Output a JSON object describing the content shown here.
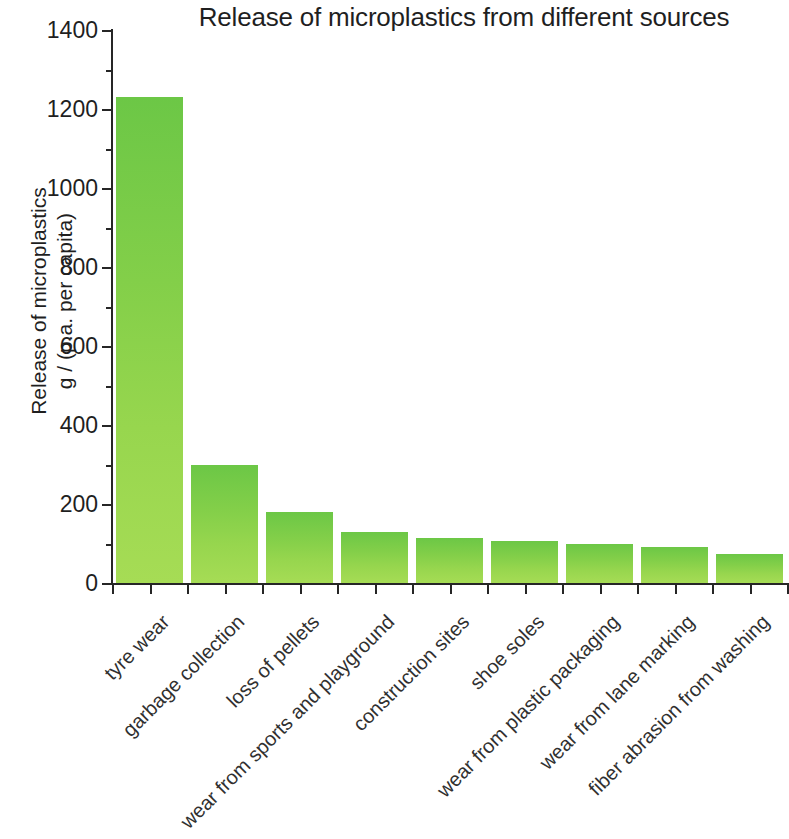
{
  "chart_data": {
    "type": "bar",
    "title": "Release of microplastics from different sources",
    "xlabel": "",
    "ylabel_line1": "Release of microplastics",
    "ylabel_line2": "g / (p.a. per capita)",
    "ylim": [
      0,
      1400
    ],
    "ytick_step": 200,
    "yminor_step": 100,
    "grid": false,
    "legend": "none",
    "bar_color_top": "#6CC746",
    "bar_color_bottom": "#A6DC55",
    "categories": [
      "tyre wear",
      "garbage collection",
      "loss of pellets",
      "wear from sports and playground",
      "construction sites",
      "shoe soles",
      "wear from plastic packaging",
      "wear from lane marking",
      "fiber abrasion from washing"
    ],
    "values": [
      1230,
      300,
      180,
      130,
      115,
      107,
      98,
      90,
      74
    ],
    "yticks": [
      0,
      200,
      400,
      600,
      800,
      1000,
      1200,
      1400
    ],
    "ytick_labels": [
      "0",
      "200",
      "400",
      "600",
      "800",
      "1000",
      "1200",
      "1400"
    ],
    "yminor_ticks": [
      100,
      300,
      500,
      700,
      900,
      1100,
      1300
    ]
  }
}
